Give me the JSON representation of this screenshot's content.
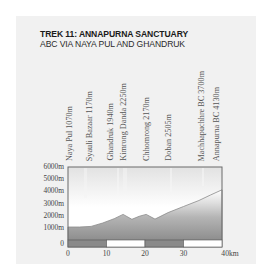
{
  "header": {
    "title": "TREK 11: ANNAPURNA SANCTUARY",
    "subtitle": "ABC VIA NAYA PUL AND GHANDRUK"
  },
  "waypoints": [
    {
      "label": "Naya Pul 1070m",
      "x": 71
    },
    {
      "label": "Syauli Bazaar 1170m",
      "x": 91
    },
    {
      "label": "Ghandruk 1940m",
      "x": 112
    },
    {
      "label": "Kimrong Danda 2250m",
      "x": 125
    },
    {
      "label": "Chhomrong 2170m",
      "x": 148
    },
    {
      "label": "Doban 2505m",
      "x": 170
    },
    {
      "label": "Machhapuchhre BC 3700m",
      "x": 203
    },
    {
      "label": "Annapurna BC 4130m",
      "x": 218
    }
  ],
  "axes": {
    "y_labels": [
      "6000m",
      "5000m",
      "4000m",
      "3000m",
      "2000m",
      "1000m",
      "0"
    ],
    "x_labels": [
      "0",
      "10",
      "20",
      "30",
      "40km"
    ]
  },
  "colors": {
    "card_bg": "#f1f1f1",
    "frame": "#6b6b6b",
    "profile_fill_top": "#cfcfcf",
    "profile_fill_bottom": "#8c8c8c",
    "sky_top": "#e4e4e4",
    "sky_bottom": "#ffffff",
    "scale_dark": "#8a8a8a",
    "scale_light": "#ffffff"
  },
  "chart_data": {
    "type": "area",
    "title": "TREK 11: ANNAPURNA SANCTUARY",
    "subtitle": "ABC VIA NAYA PUL AND GHANDRUK",
    "xlabel": "Distance (km)",
    "ylabel": "Altitude (m)",
    "xlim": [
      0,
      40
    ],
    "ylim": [
      0,
      6000
    ],
    "x_ticks": [
      0,
      10,
      20,
      30,
      40
    ],
    "x_tick_labels": [
      "0",
      "10",
      "20",
      "30",
      "40km"
    ],
    "y_ticks": [
      0,
      1000,
      2000,
      3000,
      4000,
      5000,
      6000
    ],
    "y_tick_labels": [
      "0",
      "1000m",
      "2000m",
      "3000m",
      "4000m",
      "5000m",
      "6000m"
    ],
    "grid": false,
    "legend": null,
    "series": [
      {
        "name": "Elevation profile",
        "x": [
          0,
          3,
          6,
          9,
          12,
          14.3,
          16.6,
          18.5,
          20.3,
          22.6,
          26,
          30,
          34,
          37,
          40
        ],
        "y": [
          1070,
          1070,
          1120,
          1400,
          1750,
          2100,
          1700,
          1950,
          2100,
          1720,
          2250,
          2750,
          3250,
          3700,
          4130
        ]
      }
    ],
    "annotations": [
      {
        "text": "Naya Pul 1070m",
        "x": 0.5
      },
      {
        "text": "Syauli Bazaar 1170m",
        "x": 6
      },
      {
        "text": "Ghandruk 1940m",
        "x": 11.5
      },
      {
        "text": "Kimrong Danda 2250m",
        "x": 14.8
      },
      {
        "text": "Chhomrong 2170m",
        "x": 20.5
      },
      {
        "text": "Doban 2505m",
        "x": 26
      },
      {
        "text": "Machhapuchhre BC 3700m",
        "x": 35
      },
      {
        "text": "Annapurna BC 4130m",
        "x": 39
      }
    ],
    "scale_bar": {
      "segments": [
        {
          "from": 0,
          "to": 10,
          "fill": "dark"
        },
        {
          "from": 10,
          "to": 20,
          "fill": "light"
        },
        {
          "from": 20,
          "to": 30,
          "fill": "dark"
        },
        {
          "from": 30,
          "to": 40,
          "fill": "light"
        }
      ]
    }
  }
}
